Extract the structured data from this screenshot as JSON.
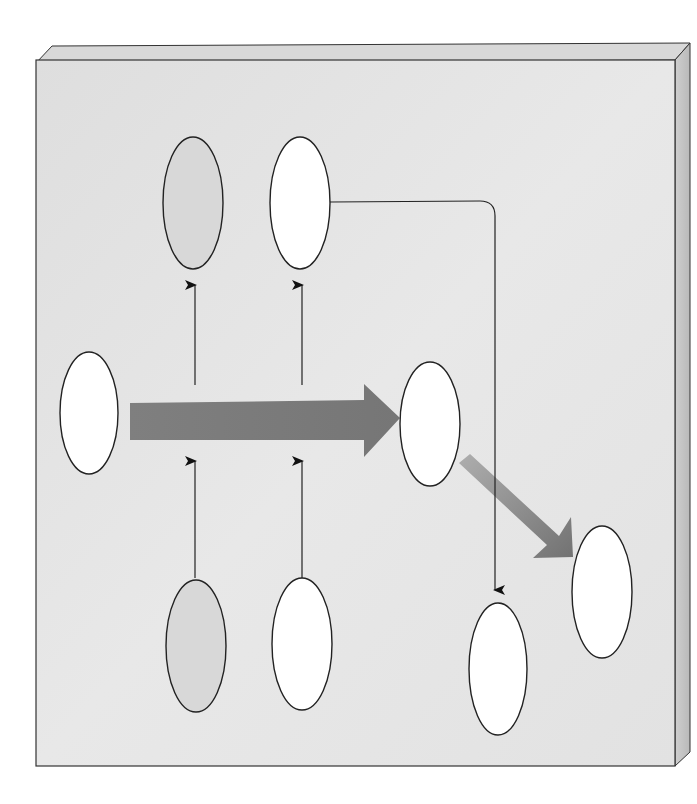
{
  "diagram": {
    "title": "",
    "labels": [],
    "colors": {
      "background": "#ffffff",
      "slab_face": "#e4e4e4",
      "slab_top": "#d6d6d6",
      "slab_side": "#c6c6c6",
      "slab_edge": "#333333",
      "ellipse_white": "#ffffff",
      "ellipse_gray": "#d8d8d8",
      "ellipse_stroke": "#222222",
      "connector": "#111111",
      "big_arrow": "#7c7c7c",
      "diag_arrow_start": "#a8a8a8",
      "diag_arrow_end": "#6e6e6e"
    },
    "nodes": [
      {
        "id": "left-input",
        "fill": "white",
        "cx": 89,
        "cy": 413,
        "rx": 29,
        "ry": 61
      },
      {
        "id": "top-gray",
        "fill": "gray",
        "cx": 193,
        "cy": 203,
        "rx": 30,
        "ry": 66
      },
      {
        "id": "top-white",
        "fill": "white",
        "cx": 300,
        "cy": 203,
        "rx": 30,
        "ry": 66
      },
      {
        "id": "center-right",
        "fill": "white",
        "cx": 430,
        "cy": 424,
        "rx": 30,
        "ry": 62
      },
      {
        "id": "bottom-gray",
        "fill": "gray",
        "cx": 196,
        "cy": 646,
        "rx": 30,
        "ry": 66
      },
      {
        "id": "bottom-white",
        "fill": "white",
        "cx": 302,
        "cy": 644,
        "rx": 30,
        "ry": 66
      },
      {
        "id": "bottom-right-low",
        "fill": "white",
        "cx": 498,
        "cy": 669,
        "rx": 29,
        "ry": 66
      },
      {
        "id": "far-right",
        "fill": "white",
        "cx": 602,
        "cy": 592,
        "rx": 30,
        "ry": 66
      }
    ],
    "edges": [
      {
        "id": "main-flow",
        "type": "thick-arrow",
        "from": "left-input",
        "to": "center-right"
      },
      {
        "id": "to-top-gray",
        "type": "thin-arrow",
        "from": "main-flow",
        "to": "top-gray"
      },
      {
        "id": "to-top-white",
        "type": "thin-arrow",
        "from": "main-flow",
        "to": "top-white"
      },
      {
        "id": "from-bottom-gray",
        "type": "thin-arrow",
        "from": "bottom-gray",
        "to": "main-flow"
      },
      {
        "id": "from-bottom-white",
        "type": "thin-arrow",
        "from": "bottom-white",
        "to": "main-flow"
      },
      {
        "id": "top-white-to-bottom-right",
        "type": "thin-elbow-arrow",
        "from": "top-white",
        "to": "bottom-right-low"
      },
      {
        "id": "diagonal-flow",
        "type": "thick-gradient-arrow",
        "from": "center-right",
        "to": "far-right"
      }
    ]
  }
}
